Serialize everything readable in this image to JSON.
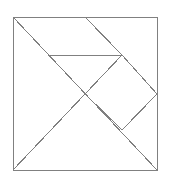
{
  "figure": {
    "name": "tangram-puzzle-diagram",
    "type": "line-diagram",
    "title": "",
    "background_color": "#ffffff",
    "stroke_color": "#808080",
    "stroke_width": 1,
    "canvas": {
      "width": 169,
      "height": 185
    },
    "outer_square": {
      "label": "outer-square",
      "x": 13,
      "y": 17,
      "width": 144,
      "height": 153,
      "corners": {
        "top_left": [
          13,
          17
        ],
        "top_right": [
          157,
          17
        ],
        "bottom_right": [
          157,
          170
        ],
        "bottom_left": [
          13,
          170
        ]
      }
    },
    "vertices": {
      "top_left": [
        13,
        17
      ],
      "top_right": [
        157,
        17
      ],
      "bottom_right": [
        157,
        170
      ],
      "bottom_left": [
        13,
        170
      ],
      "top_mid": [
        85,
        17
      ],
      "center_cross": [
        85,
        94
      ],
      "diamond_top": [
        122,
        55
      ],
      "diamond_right": [
        157,
        94
      ],
      "diamond_bottom": [
        122,
        130
      ],
      "horizontal_left": [
        48,
        55
      ],
      "right_edge_mid": [
        157,
        94
      ]
    },
    "segments": [
      {
        "name": "square-top-edge",
        "from": [
          13,
          17
        ],
        "to": [
          157,
          17
        ]
      },
      {
        "name": "square-right-edge",
        "from": [
          157,
          17
        ],
        "to": [
          157,
          170
        ]
      },
      {
        "name": "square-bottom-edge",
        "from": [
          157,
          170
        ],
        "to": [
          13,
          170
        ]
      },
      {
        "name": "square-left-edge",
        "from": [
          13,
          170
        ],
        "to": [
          13,
          17
        ]
      },
      {
        "name": "main-diagonal",
        "from": [
          13,
          17
        ],
        "to": [
          157,
          170
        ]
      },
      {
        "name": "top-mid-to-center",
        "from": [
          85,
          17
        ],
        "to": [
          122,
          55
        ]
      },
      {
        "name": "center-diagonal-left",
        "from": [
          122,
          55
        ],
        "to": [
          85,
          94
        ]
      },
      {
        "name": "center-to-bottom-left",
        "from": [
          85,
          94
        ],
        "to": [
          13,
          170
        ]
      },
      {
        "name": "horizontal-divider",
        "from": [
          48,
          55
        ],
        "to": [
          122,
          55
        ]
      },
      {
        "name": "diamond-top-right",
        "from": [
          122,
          55
        ],
        "to": [
          157,
          94
        ]
      },
      {
        "name": "diamond-bottom-right",
        "from": [
          157,
          94
        ],
        "to": [
          122,
          130
        ]
      },
      {
        "name": "diamond-bottom-left",
        "from": [
          122,
          130
        ],
        "to": [
          85,
          94
        ]
      }
    ]
  }
}
